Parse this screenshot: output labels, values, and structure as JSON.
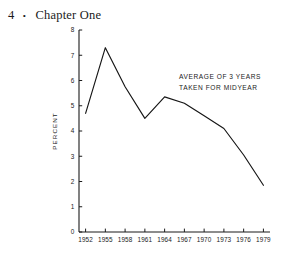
{
  "page": {
    "folio": "4",
    "separator": "•",
    "chapter_title": "Chapter One"
  },
  "chart_data": {
    "type": "line",
    "title": "",
    "xlabel": "",
    "ylabel": "PERCENT",
    "xlim": [
      1951,
      1980
    ],
    "ylim": [
      0,
      8
    ],
    "grid": false,
    "legend": "none",
    "annotations": [
      {
        "name": "average-note",
        "line1": "AVERAGE OF 3 YEARS",
        "line2": "TAKEN FOR MIDYEAR"
      }
    ],
    "ytick_labels": [
      "0",
      "1",
      "2",
      "3",
      "4",
      "5",
      "6",
      "7",
      "8"
    ],
    "yticks": [
      0,
      1,
      2,
      3,
      4,
      5,
      6,
      7,
      8
    ],
    "xtick_labels": [
      "1952",
      "1955",
      "1958",
      "1961",
      "1964",
      "1967",
      "1970",
      "1973",
      "1976",
      "1979"
    ],
    "xticks": [
      1952,
      1955,
      1958,
      1961,
      1964,
      1967,
      1970,
      1973,
      1976,
      1979
    ],
    "x": [
      1952,
      1955,
      1958,
      1961,
      1964,
      1967,
      1970,
      1973,
      1976,
      1979
    ],
    "values": [
      4.7,
      7.3,
      5.75,
      4.5,
      5.35,
      5.1,
      4.6,
      4.1,
      3.05,
      1.85
    ],
    "series": [
      {
        "name": "percent",
        "values": [
          4.7,
          7.3,
          5.75,
          4.5,
          5.35,
          5.1,
          4.6,
          4.1,
          3.05,
          1.85
        ]
      }
    ]
  }
}
